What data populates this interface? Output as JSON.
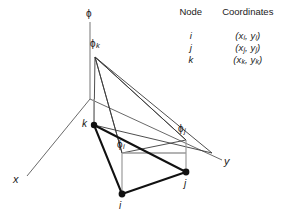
{
  "figure": {
    "axes": {
      "phi": "ϕ",
      "x": "x",
      "y": "y"
    },
    "nodes": [
      {
        "id": "i",
        "label": "i"
      },
      {
        "id": "j",
        "label": "j"
      },
      {
        "id": "k",
        "label": "k"
      }
    ],
    "field_labels": {
      "phi_i_base": "ϕ",
      "phi_i_sub": "i",
      "phi_j_base": "ϕ",
      "phi_j_sub": "j",
      "phi_k_base": "ϕ",
      "phi_k_sub": "k"
    },
    "colors": {
      "line_dark": "#1a1a1a",
      "line_thin": "#3a3a3a",
      "line_gray": "#8c8c8c",
      "node_fill": "#111111",
      "background": "#ffffff"
    }
  },
  "legend": {
    "headers": {
      "node": "Node",
      "coordinates": "Coordinates"
    },
    "rows": [
      {
        "node": "i",
        "x": "x",
        "xsub": "i",
        "y": "y",
        "ysub": "i"
      },
      {
        "node": "j",
        "x": "x",
        "xsub": "j",
        "y": "y",
        "ysub": "j"
      },
      {
        "node": "k",
        "x": "x",
        "xsub": "k",
        "y": "y",
        "ysub": "k"
      }
    ]
  }
}
